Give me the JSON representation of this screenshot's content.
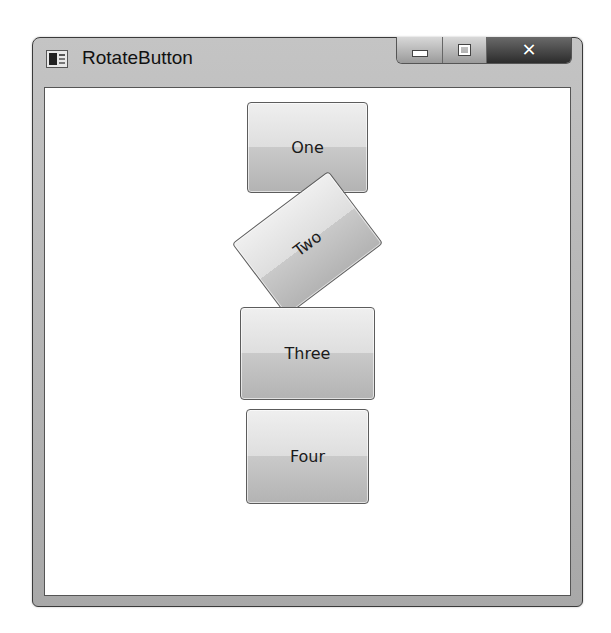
{
  "window": {
    "title": "RotateButton",
    "icon": "app-window-icon",
    "caption_buttons": {
      "minimize": {
        "icon": "minimize-icon",
        "glyph": ""
      },
      "maximize": {
        "icon": "maximize-icon",
        "glyph": ""
      },
      "close": {
        "icon": "close-icon",
        "glyph": "✕"
      }
    }
  },
  "buttons": [
    {
      "label": "One",
      "rotation_deg": 0
    },
    {
      "label": "Two",
      "rotation_deg": -37
    },
    {
      "label": "Three",
      "rotation_deg": 0
    },
    {
      "label": "Four",
      "rotation_deg": 0
    }
  ]
}
